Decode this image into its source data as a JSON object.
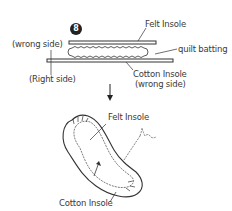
{
  "step": {
    "number": "8"
  },
  "top_diagram": {
    "labels": {
      "felt_insole": "Felt Insole",
      "wrong_side": "(wrong side)",
      "quilt_batting": "quilt batting",
      "right_side": "(Right side)",
      "cotton_insole_line1": "Cotton Insole",
      "cotton_insole_line2": "(wrong side)"
    }
  },
  "bottom_diagram": {
    "labels": {
      "felt_insole": "Felt Insole",
      "cotton_insole": "Cotton Insole"
    }
  },
  "colors": {
    "line": "#333333",
    "badge": "#222222",
    "background": "#ffffff"
  }
}
